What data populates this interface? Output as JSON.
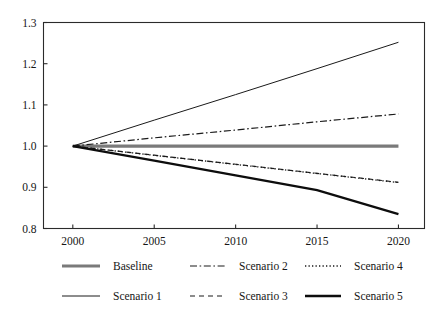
{
  "chart_data": {
    "type": "line",
    "title": "",
    "subtitle": "",
    "xlabel": "",
    "ylabel": "",
    "xlim": [
      1998.2,
      2021.6
    ],
    "ylim": [
      0.8,
      1.3
    ],
    "xticks": [
      "2000",
      "2005",
      "2010",
      "2015",
      "2020"
    ],
    "xtick_values": [
      2000,
      2005,
      2010,
      2015,
      2020
    ],
    "yticks": [
      "0.8",
      "0.9",
      "1.0",
      "1.1",
      "1.2",
      "1.3"
    ],
    "ytick_values": [
      0.8,
      0.9,
      1.0,
      1.1,
      1.2,
      1.3
    ],
    "grid": false,
    "legend_position": "bottom",
    "x": [
      2000,
      2005,
      2010,
      2015,
      2020
    ],
    "series": [
      {
        "name": "Baseline",
        "values": [
          1.0,
          1.0,
          1.0,
          1.0,
          1.0
        ],
        "style": "solid-thick-gray",
        "color": "#7a7a7a",
        "width": 3.2,
        "dash": ""
      },
      {
        "name": "Scenario 1",
        "values": [
          1.0,
          1.063,
          1.125,
          1.188,
          1.252
        ],
        "style": "solid-thin",
        "color": "#1a1a1a",
        "width": 1.0,
        "dash": ""
      },
      {
        "name": "Scenario 2",
        "values": [
          1.0,
          1.02,
          1.039,
          1.059,
          1.078
        ],
        "style": "dash-dot",
        "color": "#1a1a1a",
        "width": 1.2,
        "dash": "7,2.6,1.6,2.6"
      },
      {
        "name": "Scenario 3",
        "values": [
          1.0,
          0.978,
          0.956,
          0.934,
          0.912
        ],
        "style": "dashed",
        "color": "#1a1a1a",
        "width": 1.2,
        "dash": "5,4"
      },
      {
        "name": "Scenario 4",
        "values": [
          1.0,
          0.9775,
          0.9555,
          0.9335,
          0.9115
        ],
        "style": "dotted",
        "color": "#1a1a1a",
        "width": 1.3,
        "dash": "1.3,2.2"
      },
      {
        "name": "Scenario 5",
        "values": [
          1.0,
          0.965,
          0.929,
          0.893,
          0.835
        ],
        "style": "solid-bold",
        "color": "#0d0d0d",
        "width": 2.3,
        "dash": ""
      }
    ]
  },
  "legend": {
    "entries": [
      {
        "label": "Baseline",
        "series": "Baseline"
      },
      {
        "label": "Scenario 2",
        "series": "Scenario 2"
      },
      {
        "label": "Scenario 4",
        "series": "Scenario 4"
      },
      {
        "label": "Scenario 1",
        "series": "Scenario 1"
      },
      {
        "label": "Scenario 3",
        "series": "Scenario 3"
      },
      {
        "label": "Scenario 5",
        "series": "Scenario 5"
      }
    ]
  },
  "colors": {
    "axis": "#2b2b2b",
    "text": "#161616",
    "baseline_gray": "#7a7a7a",
    "background": "#ffffff"
  }
}
